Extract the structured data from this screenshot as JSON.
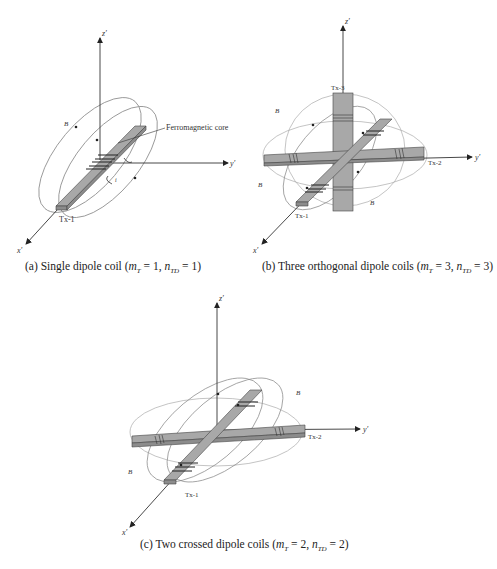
{
  "figure": {
    "panels": [
      {
        "id": "a",
        "caption_prefix": "(a) Single dipole coil (",
        "m_label": "m",
        "m_sub": "T",
        "m_value": " = 1, ",
        "n_label": "n",
        "n_sub": "TD",
        "n_value": " = 1)",
        "axes": {
          "x": "x′",
          "y": "y′",
          "z": "z′"
        },
        "labels": {
          "core": "Ferromagnetic core",
          "coil": "Tx-1",
          "field": "Bx",
          "current": "iTx1"
        }
      },
      {
        "id": "b",
        "caption_prefix": "(b) Three orthogonal dipole coils (",
        "m_label": "m",
        "m_sub": "T",
        "m_value": " = 3, ",
        "n_label": "n",
        "n_sub": "TD",
        "n_value": " = 3)",
        "axes": {
          "x": "x′",
          "y": "y′",
          "z": "z′"
        },
        "labels": {
          "coil1": "Tx-1",
          "coil2": "Tx-2",
          "coil3": "Tx-3",
          "field_x": "Bx",
          "field_y": "By",
          "field_z": "Bz",
          "i1": "iTx1",
          "i2": "iTx2",
          "i3": "iTx3"
        }
      },
      {
        "id": "c",
        "caption_prefix": "(c) Two crossed dipole coils (",
        "m_label": "m",
        "m_sub": "T",
        "m_value": " = 2, ",
        "n_label": "n",
        "n_sub": "TD",
        "n_value": " = 2)",
        "axes": {
          "x": "x′",
          "y": "y′",
          "z": "z′"
        },
        "labels": {
          "coil1": "Tx-1",
          "coil2": "Tx-2",
          "field_x": "Bx",
          "field_y": "By",
          "i1": "iTx1",
          "i2": "iTx2"
        }
      }
    ],
    "colors": {
      "core_fill": "#a8a8a8",
      "core_side": "#8c8c8c",
      "field_line": "#8a8a8a",
      "axis": "#333333"
    }
  }
}
